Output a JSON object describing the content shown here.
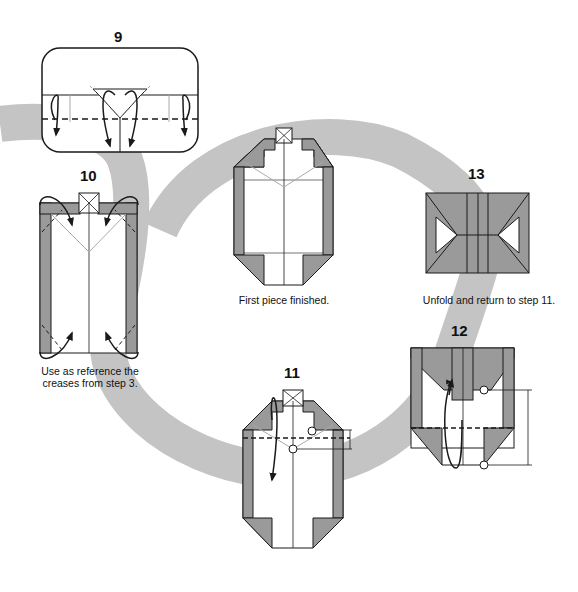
{
  "colors": {
    "paper_colored": "#9a9a9a",
    "paper_white": "#ffffff",
    "arc": "#c4c4c4",
    "line": "#1a1a1a",
    "crease": "#aaaaaa"
  },
  "steps": [
    {
      "number": "9",
      "caption": ""
    },
    {
      "number": "10",
      "caption_lines": [
        "Use as reference the",
        "creases from step 3."
      ]
    },
    {
      "number": "",
      "caption": "First piece finished."
    },
    {
      "number": "13",
      "caption": "Unfold and return to step 11."
    },
    {
      "number": "12",
      "caption": ""
    },
    {
      "number": "11",
      "caption": ""
    }
  ]
}
